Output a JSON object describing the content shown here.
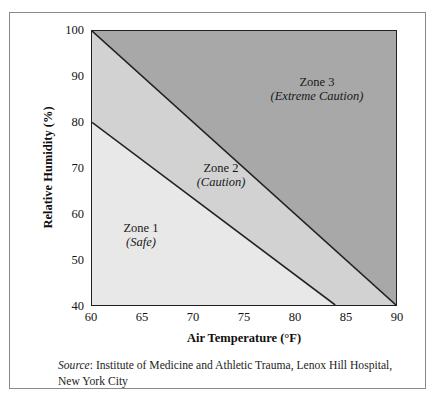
{
  "figure": {
    "border_color": "#8a8a8a"
  },
  "axes": {
    "x_title": "Air Temperature (°F)",
    "y_title": "Relative Humidity (%)",
    "x_ticks": [
      "60",
      "65",
      "70",
      "75",
      "80",
      "85",
      "90"
    ],
    "y_ticks": [
      "100",
      "90",
      "80",
      "70",
      "60",
      "50",
      "40"
    ]
  },
  "zones": [
    {
      "name": "Zone 1",
      "sub": "(Safe)",
      "color": "#e8e8e8"
    },
    {
      "name": "Zone 2",
      "sub": "(Caution)",
      "color": "#d2d2d2"
    },
    {
      "name": "Zone 3",
      "sub": "(Extreme Caution)",
      "color": "#a8a8a8"
    }
  ],
  "source": {
    "label": "Source",
    "separator": ":",
    "text": "Institute of Medicine and Athletic Trauma, Lenox Hill Hospital, New York City"
  },
  "chart_data": {
    "type": "area",
    "title": "",
    "subtitle": "",
    "xlabel": "Air Temperature (°F)",
    "ylabel": "Relative Humidity (%)",
    "xlim": [
      60,
      90
    ],
    "ylim": [
      40,
      100
    ],
    "xticks": [
      60,
      65,
      70,
      75,
      80,
      85,
      90
    ],
    "yticks": [
      40,
      50,
      60,
      70,
      80,
      90,
      100
    ],
    "grid": false,
    "legend": "none",
    "annotations": [
      {
        "text": "Zone 3 (Extreme Caution)",
        "x": 80.5,
        "y": 85
      },
      {
        "text": "Zone 2 (Caution)",
        "x": 71.5,
        "y": 68
      },
      {
        "text": "Zone 1 (Safe)",
        "x": 66.5,
        "y": 54
      }
    ],
    "boundaries": [
      {
        "name": "Zone 1 / Zone 2 boundary",
        "points": [
          [
            60,
            80
          ],
          [
            84,
            40
          ]
        ]
      },
      {
        "name": "Zone 2 / Zone 3 boundary",
        "points": [
          [
            60,
            100
          ],
          [
            90,
            40
          ]
        ]
      }
    ],
    "series": [
      {
        "name": "Zone 1 (Safe)",
        "fill": "#e8e8e8",
        "polygon": [
          [
            60,
            80
          ],
          [
            84,
            40
          ],
          [
            60,
            40
          ]
        ]
      },
      {
        "name": "Zone 2 (Caution)",
        "fill": "#d2d2d2",
        "polygon": [
          [
            60,
            100
          ],
          [
            90,
            40
          ],
          [
            84,
            40
          ],
          [
            60,
            80
          ]
        ]
      },
      {
        "name": "Zone 3 (Extreme Caution)",
        "fill": "#a8a8a8",
        "polygon": [
          [
            60,
            100
          ],
          [
            90,
            100
          ],
          [
            90,
            40
          ]
        ]
      }
    ]
  }
}
